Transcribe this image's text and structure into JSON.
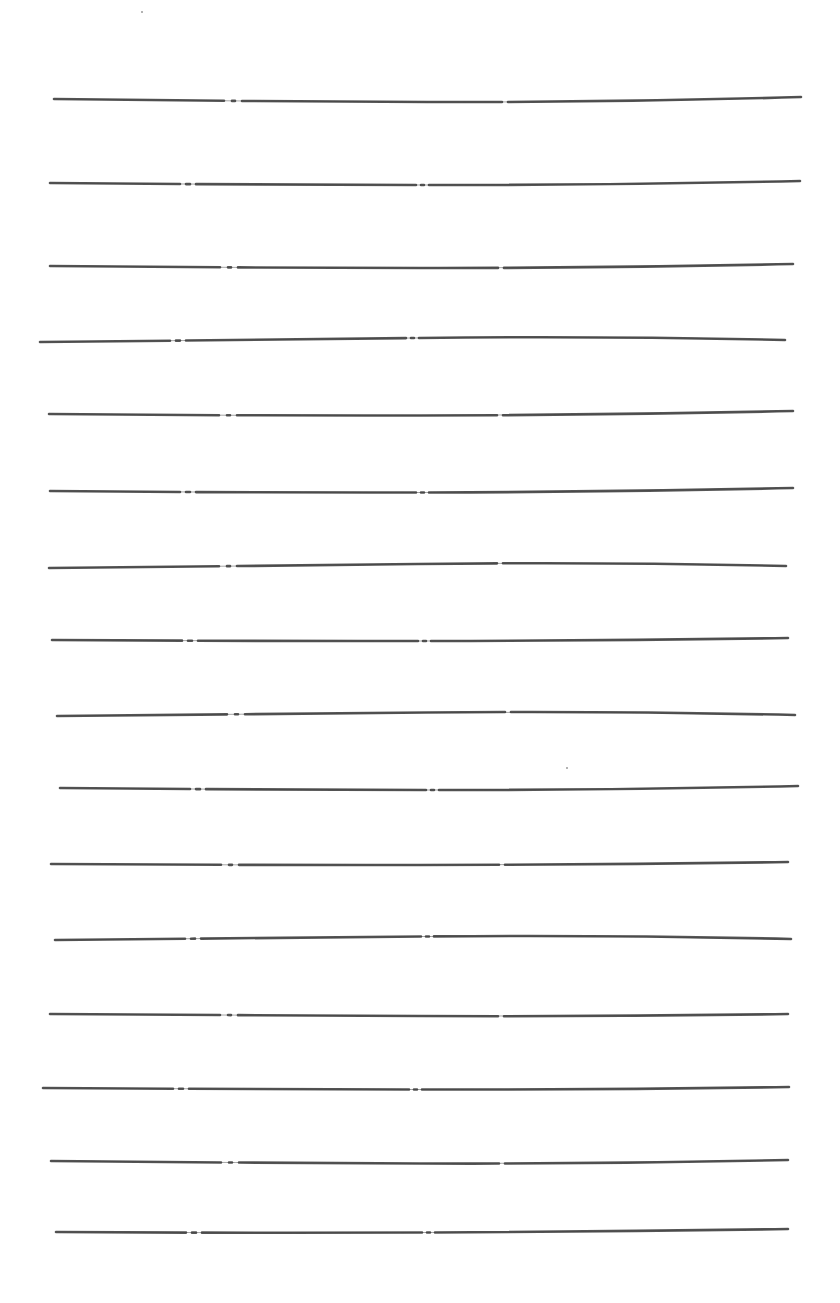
{
  "page": {
    "kind": "hand-ruled lined sheet",
    "background": "#ffffff",
    "ink_color": "#3a3a3a",
    "line_count": 16
  },
  "lines": [
    {
      "y1": 99,
      "y2": 97,
      "x1": 54,
      "x2": 801,
      "dip": 4
    },
    {
      "y1": 183,
      "y2": 181,
      "x1": 50,
      "x2": 800,
      "dip": 3
    },
    {
      "y1": 266,
      "y2": 264,
      "x1": 50,
      "x2": 793,
      "dip": 3
    },
    {
      "y1": 342,
      "y2": 340,
      "x1": 40,
      "x2": 785,
      "dip": -3
    },
    {
      "y1": 414,
      "y2": 411,
      "x1": 49,
      "x2": 793,
      "dip": 3
    },
    {
      "y1": 491,
      "y2": 488,
      "x1": 50,
      "x2": 793,
      "dip": 3
    },
    {
      "y1": 568,
      "y2": 566,
      "x1": 49,
      "x2": 786,
      "dip": -3
    },
    {
      "y1": 640,
      "y2": 638,
      "x1": 52,
      "x2": 788,
      "dip": 2
    },
    {
      "y1": 716,
      "y2": 715,
      "x1": 57,
      "x2": 795,
      "dip": -3
    },
    {
      "y1": 788,
      "y2": 786,
      "x1": 60,
      "x2": 798,
      "dip": 3
    },
    {
      "y1": 864,
      "y2": 862,
      "x1": 51,
      "x2": 788,
      "dip": 2
    },
    {
      "y1": 940,
      "y2": 939,
      "x1": 55,
      "x2": 791,
      "dip": -3
    },
    {
      "y1": 1014,
      "y2": 1014,
      "x1": 50,
      "x2": 788,
      "dip": 2
    },
    {
      "y1": 1088,
      "y2": 1087,
      "x1": 43,
      "x2": 789,
      "dip": 2
    },
    {
      "y1": 1161,
      "y2": 1160,
      "x1": 51,
      "x2": 788,
      "dip": 3
    },
    {
      "y1": 1232,
      "y2": 1229,
      "x1": 56,
      "x2": 788,
      "dip": 2
    }
  ],
  "specks": [
    {
      "x": 566,
      "y": 767
    },
    {
      "x": 141,
      "y": 11
    }
  ]
}
